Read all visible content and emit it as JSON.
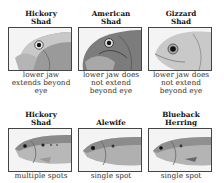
{
  "grid": {
    "top_row": [
      {
        "title_line1": "Hickory",
        "title_line2": "Shad",
        "image": "hickory-shad-head-illustration",
        "caption_lines": [
          "lower jaw",
          "extends beyond",
          "eye"
        ]
      },
      {
        "title_line1": "American",
        "title_line2": "Shad",
        "image": "american-shad-head-illustration",
        "caption_lines": [
          "lower jaw does",
          "not extend",
          "beyond eye"
        ]
      },
      {
        "title_line1": "Gizzard",
        "title_line2": "Shad",
        "image": "gizzard-shad-head-illustration",
        "caption_lines": [
          "lower jaw does",
          "not extend",
          "beyond eye"
        ]
      }
    ],
    "bottom_row": [
      {
        "title_line1": "Hickory",
        "title_line2": "Shad",
        "image": "hickory-shad-body-illustration",
        "caption": "multiple spots"
      },
      {
        "title_line1": "",
        "title_line2": "Alewife",
        "image": "alewife-body-illustration",
        "caption": "single spot"
      },
      {
        "title_line1": "Blueback",
        "title_line2": "Herring",
        "image": "blueback-herring-body-illustration",
        "caption": "single spot"
      }
    ]
  },
  "colors": {
    "border": "#444444",
    "title": "#111111",
    "caption": "#333333",
    "fish_shade": "#8a8a8a"
  }
}
